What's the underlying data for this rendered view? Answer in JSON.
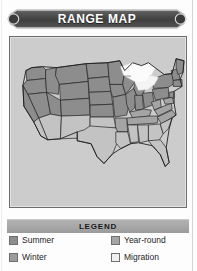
{
  "header": {
    "title": "RANGE MAP",
    "banner_color": "#4a4a4a",
    "banner_text_color": "#ffffff"
  },
  "map": {
    "panel_background": "#cccccc",
    "border_color": "#6d6d6d",
    "outline_color": "#2b2b2b",
    "region_name": "United States",
    "fills": {
      "summer": "#8c8c8c",
      "winter": "#c0c0c0",
      "year_round": "#a3a3a3",
      "migration": "#f2f2f2",
      "water": "#fbfbfb"
    },
    "state_categories": {
      "summer": [
        "WA",
        "OR",
        "ID",
        "MT",
        "WY",
        "ND",
        "SD",
        "NE",
        "MN",
        "IA",
        "WI",
        "MI",
        "NV",
        "UT",
        "CO",
        "KS",
        "MO",
        "IL",
        "IN",
        "OH",
        "PA",
        "NY",
        "VT",
        "NH",
        "ME",
        "MA",
        "CT",
        "RI",
        "NJ",
        "CA-north"
      ],
      "year_round": [
        "KY",
        "WV",
        "VA",
        "MD",
        "DE",
        "TN",
        "NC",
        "AR",
        "OK-north"
      ],
      "winter": [
        "TX",
        "LA",
        "MS",
        "AL",
        "GA",
        "FL",
        "SC",
        "AZ",
        "NM",
        "OK-south",
        "CA-south"
      ],
      "migration": [
        "Great Lakes corridor"
      ]
    }
  },
  "legend": {
    "title": "LEGEND",
    "bird_icon_name": "flying-bird-icon",
    "bird_icon_color": "#d8d8d8",
    "items": [
      {
        "label": "Summer",
        "color": "#8c8c8c",
        "column": "left"
      },
      {
        "label": "Winter",
        "color": "#9a9a9a",
        "column": "left"
      },
      {
        "label": "Year-round",
        "color": "#a3a3a3",
        "column": "right"
      },
      {
        "label": "Migration",
        "color": "#f0f0f0",
        "column": "right"
      }
    ]
  }
}
